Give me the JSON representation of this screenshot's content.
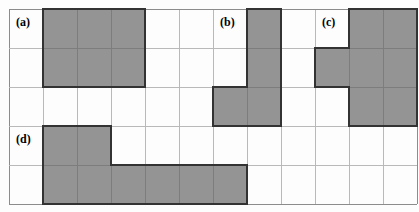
{
  "figure": {
    "title": "",
    "grid": {
      "columns": 12,
      "rows": 5,
      "cell_width": 34,
      "cell_height": 39,
      "origin_x": 9,
      "origin_y": 9,
      "line_color": "#b9b9b9",
      "border_color": "#8c8c8c"
    },
    "style": {
      "fill_color": "#949494",
      "outline_color": "#333333",
      "seam_color": "#7d7d7d",
      "background_color": "#ffffff",
      "label_color": "#000000"
    },
    "shapes": [
      {
        "id": "a",
        "label": "(a)",
        "label_col": 0,
        "label_row": 0,
        "cell_count": 6,
        "description": "3 by 2 rectangle",
        "cells": [
          [
            1,
            0
          ],
          [
            2,
            0
          ],
          [
            3,
            0
          ],
          [
            1,
            1
          ],
          [
            2,
            1
          ],
          [
            3,
            1
          ]
        ]
      },
      {
        "id": "b",
        "label": "(b)",
        "label_col": 6,
        "label_row": 0,
        "cell_count": 4,
        "description": "J shape, vertical bar of three with a foot to the left at the bottom",
        "cells": [
          [
            7,
            0
          ],
          [
            7,
            1
          ],
          [
            6,
            2
          ],
          [
            7,
            2
          ]
        ]
      },
      {
        "id": "c",
        "label": "(c)",
        "label_col": 9,
        "label_row": 0,
        "cell_count": 7,
        "description": "2 by 3 block with one extra cell attached on the left of the middle row",
        "cells": [
          [
            10,
            0
          ],
          [
            11,
            0
          ],
          [
            9,
            1
          ],
          [
            10,
            1
          ],
          [
            11,
            1
          ],
          [
            10,
            2
          ],
          [
            11,
            2
          ]
        ]
      },
      {
        "id": "d",
        "label": "(d)",
        "label_col": 0,
        "label_row": 3,
        "cell_count": 8,
        "description": "L shape, two cells on the upper row and six cells along the bottom row",
        "cells": [
          [
            1,
            3
          ],
          [
            2,
            3
          ],
          [
            1,
            4
          ],
          [
            2,
            4
          ],
          [
            3,
            4
          ],
          [
            4,
            4
          ],
          [
            5,
            4
          ],
          [
            6,
            4
          ]
        ]
      }
    ]
  }
}
